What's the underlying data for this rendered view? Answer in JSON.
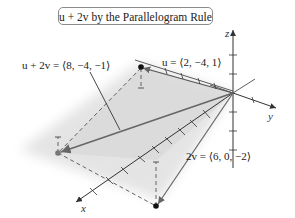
{
  "title": "u + 2v by the Parallelogram Rule",
  "labels": {
    "sum": "u + 2v = ⟨8, −4, −1⟩",
    "u": "u = ⟨2, −4, 1⟩",
    "two_v": "2v = ⟨6, 0, −2⟩"
  },
  "axes": {
    "x": "x",
    "y": "y",
    "z": "z"
  },
  "vectors": [
    {
      "name": "u",
      "components": [
        2,
        -4,
        1
      ]
    },
    {
      "name": "2v",
      "components": [
        6,
        0,
        -2
      ]
    },
    {
      "name": "u + 2v",
      "components": [
        8,
        -4,
        -1
      ]
    }
  ],
  "colors": {
    "plane": "#dcdcdc",
    "axis": "#333333",
    "vector": "#666666",
    "dashed": "#555555",
    "sum_point": "#777777",
    "point": "#111111"
  }
}
